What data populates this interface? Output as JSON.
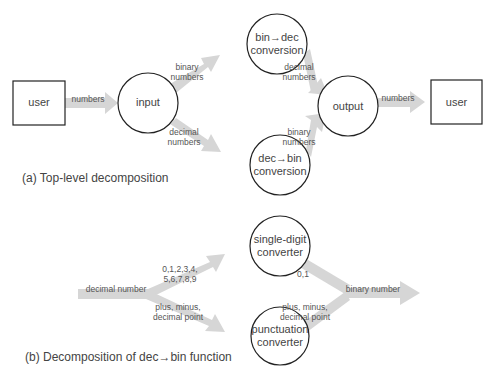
{
  "diagram_a": {
    "caption": "(a) Top-level decomposition",
    "nodes": {
      "user_left": "user",
      "input": "input",
      "bin_dec": [
        "bin→dec",
        "conversion"
      ],
      "dec_bin": [
        "dec→bin",
        "conversion"
      ],
      "output": "output",
      "user_right": "user"
    },
    "flows": {
      "user_to_input": "numbers",
      "input_to_bindec": [
        "binary",
        "numbers"
      ],
      "input_to_decbin": [
        "decimal",
        "numbers"
      ],
      "bindec_to_output": [
        "decimal",
        "numbers"
      ],
      "decbin_to_output": [
        "binary",
        "numbers"
      ],
      "output_to_user": "numbers"
    }
  },
  "diagram_b": {
    "caption": "(b) Decomposition of dec→bin function",
    "nodes": {
      "single_digit": [
        "single-digit",
        "converter"
      ],
      "punctuation": [
        "punctuation",
        "converter"
      ]
    },
    "flows": {
      "input": "decimal number",
      "to_single_digit": [
        "0,1,2,3,4,",
        "5,6,7,8,9"
      ],
      "to_punctuation": [
        "plus, minus,",
        "decimal point"
      ],
      "single_digit_out": "0,1",
      "punctuation_out": [
        "plus, minus,",
        "decimal point"
      ],
      "output": "binary number"
    }
  },
  "colors": {
    "arrow": "#d4d4d4",
    "stroke": "#222222",
    "text": "#444444"
  }
}
